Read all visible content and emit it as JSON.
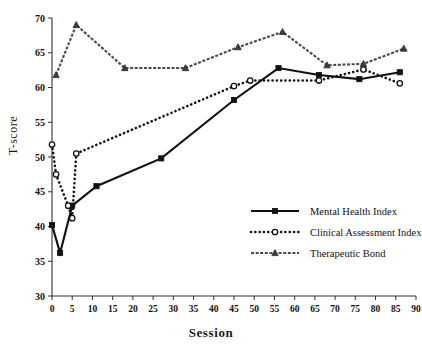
{
  "chart_data": {
    "type": "line",
    "title": "",
    "xlabel": "Session",
    "ylabel": "T-score",
    "xlim": [
      0,
      90
    ],
    "ylim": [
      30,
      70
    ],
    "xticks": [
      0,
      5,
      10,
      15,
      20,
      25,
      30,
      35,
      40,
      45,
      50,
      55,
      60,
      65,
      70,
      75,
      80,
      85,
      90
    ],
    "yticks": [
      30,
      35,
      40,
      45,
      50,
      55,
      60,
      65,
      70
    ],
    "grid": false,
    "legend_position": "center-right",
    "series": [
      {
        "name": "Mental Health Index",
        "marker": "square",
        "line": "solid",
        "color": "#111111",
        "points": [
          {
            "x": 0,
            "y": 40.2
          },
          {
            "x": 2,
            "y": 36.2
          },
          {
            "x": 5,
            "y": 43.0
          },
          {
            "x": 11,
            "y": 45.8
          },
          {
            "x": 27,
            "y": 49.8
          },
          {
            "x": 45,
            "y": 58.2
          },
          {
            "x": 56,
            "y": 62.8
          },
          {
            "x": 66,
            "y": 61.8
          },
          {
            "x": 76,
            "y": 61.2
          },
          {
            "x": 86,
            "y": 62.2
          }
        ]
      },
      {
        "name": "Clinical Assessment Index",
        "marker": "circle",
        "line": "dotted",
        "color": "#111111",
        "points": [
          {
            "x": 0,
            "y": 51.8
          },
          {
            "x": 1,
            "y": 47.5
          },
          {
            "x": 4,
            "y": 43.0
          },
          {
            "x": 5,
            "y": 41.2
          },
          {
            "x": 6,
            "y": 50.5
          },
          {
            "x": 45,
            "y": 60.2
          },
          {
            "x": 49,
            "y": 61.0
          },
          {
            "x": 66,
            "y": 61.0
          },
          {
            "x": 77,
            "y": 62.6
          },
          {
            "x": 86,
            "y": 60.6
          }
        ]
      },
      {
        "name": "Therapeutic Bond",
        "marker": "triangle",
        "line": "dashed",
        "color": "#4a4a4a",
        "points": [
          {
            "x": 1,
            "y": 61.8
          },
          {
            "x": 6,
            "y": 69.0
          },
          {
            "x": 18,
            "y": 62.8
          },
          {
            "x": 33,
            "y": 62.8
          },
          {
            "x": 46,
            "y": 65.8
          },
          {
            "x": 57,
            "y": 68.0
          },
          {
            "x": 68,
            "y": 63.2
          },
          {
            "x": 77,
            "y": 63.4
          },
          {
            "x": 87,
            "y": 65.6
          }
        ]
      }
    ]
  }
}
